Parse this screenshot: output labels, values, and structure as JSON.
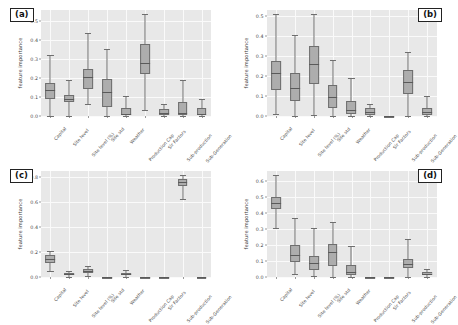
{
  "figure": {
    "ylabel": "feature importance",
    "categories": [
      "Capital",
      "Site level",
      "Site level (%)",
      "Site std",
      "Weather",
      "Production Cap",
      "Sir Factors",
      "Sub-production",
      "Sub-Generation"
    ]
  },
  "chart_data": [
    {
      "type": "boxplot",
      "panel": "(a)",
      "title": "(a)",
      "ylabel": "feature importance",
      "xlabel": "",
      "ylim": [
        0.0,
        0.56
      ],
      "yticks": [
        0.0,
        0.1,
        0.2,
        0.3,
        0.4,
        0.5
      ],
      "ytick_labels": [
        "0.0",
        "0.1",
        "0.2",
        "0.3",
        "0.4",
        "0.5"
      ],
      "grid": true,
      "legend": "none",
      "categories": [
        "Capital",
        "Site level",
        "Site level (%)",
        "Site std",
        "Weather",
        "Production Cap",
        "Sir Factors",
        "Sub-production",
        "Sub-Generation"
      ],
      "boxes": [
        {
          "label": "Capital",
          "whisker_low": 0.0,
          "q1": 0.092,
          "median": 0.135,
          "q3": 0.172,
          "whisker_high": 0.322
        },
        {
          "label": "Site level",
          "whisker_low": 0.0,
          "q1": 0.072,
          "median": 0.092,
          "q3": 0.112,
          "whisker_high": 0.19
        },
        {
          "label": "Site level (%)",
          "whisker_low": 0.062,
          "q1": 0.143,
          "median": 0.208,
          "q3": 0.248,
          "whisker_high": 0.44
        },
        {
          "label": "Site std",
          "whisker_low": 0.0,
          "q1": 0.046,
          "median": 0.126,
          "q3": 0.198,
          "whisker_high": 0.352
        },
        {
          "label": "Weather",
          "whisker_low": 0.0,
          "q1": 0.004,
          "median": 0.013,
          "q3": 0.041,
          "whisker_high": 0.108
        },
        {
          "label": "Production Cap",
          "whisker_low": 0.031,
          "q1": 0.221,
          "median": 0.28,
          "q3": 0.38,
          "whisker_high": 0.54
        },
        {
          "label": "Sir Factors",
          "whisker_low": 0.0,
          "q1": 0.006,
          "median": 0.018,
          "q3": 0.038,
          "whisker_high": 0.064
        },
        {
          "label": "Sub-production",
          "whisker_low": 0.0,
          "q1": 0.003,
          "median": 0.016,
          "q3": 0.076,
          "whisker_high": 0.19
        },
        {
          "label": "Sub-Generation",
          "whisker_low": 0.0,
          "q1": 0.004,
          "median": 0.013,
          "q3": 0.04,
          "whisker_high": 0.092
        }
      ]
    },
    {
      "type": "boxplot",
      "panel": "(b)",
      "title": "(b)",
      "ylabel": "feature importance",
      "xlabel": "",
      "ylim": [
        0.0,
        0.53
      ],
      "yticks": [
        0.0,
        0.1,
        0.2,
        0.3,
        0.4,
        0.5
      ],
      "ytick_labels": [
        "0.0",
        "0.1",
        "0.2",
        "0.3",
        "0.4",
        "0.5"
      ],
      "grid": true,
      "legend": "none",
      "categories": [
        "Capital",
        "Site level",
        "Site level (%)",
        "Site std",
        "Weather",
        "Production Cap",
        "Sir Factors",
        "Sub-production",
        "Sub-Generation"
      ],
      "boxes": [
        {
          "label": "Capital",
          "whisker_low": 0.01,
          "q1": 0.128,
          "median": 0.215,
          "q3": 0.274,
          "whisker_high": 0.508
        },
        {
          "label": "Site level",
          "whisker_low": 0.0,
          "q1": 0.073,
          "median": 0.138,
          "q3": 0.216,
          "whisker_high": 0.404
        },
        {
          "label": "Site level (%)",
          "whisker_low": 0.004,
          "q1": 0.16,
          "median": 0.262,
          "q3": 0.352,
          "whisker_high": 0.512
        },
        {
          "label": "Site std",
          "whisker_low": 0.002,
          "q1": 0.04,
          "median": 0.096,
          "q3": 0.156,
          "whisker_high": 0.282
        },
        {
          "label": "Weather",
          "whisker_low": 0.0,
          "q1": 0.008,
          "median": 0.031,
          "q3": 0.074,
          "whisker_high": 0.188
        },
        {
          "label": "Production Cap",
          "whisker_low": 0.0,
          "q1": 0.004,
          "median": 0.018,
          "q3": 0.038,
          "whisker_high": 0.06
        },
        {
          "label": "Sir Factors",
          "whisker_low": 0.0,
          "q1": 0.0,
          "median": 0.0,
          "q3": 0.001,
          "whisker_high": 0.002
        },
        {
          "label": "Sub-production",
          "whisker_low": 0.0,
          "q1": 0.112,
          "median": 0.172,
          "q3": 0.23,
          "whisker_high": 0.318
        },
        {
          "label": "Sub-Generation",
          "whisker_low": 0.0,
          "q1": 0.006,
          "median": 0.02,
          "q3": 0.042,
          "whisker_high": 0.1
        }
      ]
    },
    {
      "type": "boxplot",
      "panel": "(c)",
      "title": "(c)",
      "ylabel": "feature importance",
      "xlabel": "",
      "ylim": [
        0.0,
        0.85
      ],
      "yticks": [
        0.0,
        0.2,
        0.4,
        0.6,
        0.8
      ],
      "ytick_labels": [
        "0.0",
        "0.2",
        "0.4",
        "0.6",
        "0.8"
      ],
      "grid": true,
      "legend": "none",
      "categories": [
        "Capital",
        "Site level",
        "Site level (%)",
        "Site std",
        "Weather",
        "Production Cap",
        "Sir Factors",
        "Sub-production",
        "Sub-Generation"
      ],
      "boxes": [
        {
          "label": "Capital",
          "whisker_low": 0.046,
          "q1": 0.11,
          "median": 0.148,
          "q3": 0.178,
          "whisker_high": 0.212
        },
        {
          "label": "Site level",
          "whisker_low": 0.003,
          "q1": 0.013,
          "median": 0.024,
          "q3": 0.034,
          "whisker_high": 0.052
        },
        {
          "label": "Site level (%)",
          "whisker_low": 0.006,
          "q1": 0.032,
          "median": 0.05,
          "q3": 0.068,
          "whisker_high": 0.088
        },
        {
          "label": "Site std",
          "whisker_low": 0.0,
          "q1": 0.0,
          "median": 0.001,
          "q3": 0.002,
          "whisker_high": 0.003
        },
        {
          "label": "Weather",
          "whisker_low": 0.002,
          "q1": 0.013,
          "median": 0.022,
          "q3": 0.034,
          "whisker_high": 0.06
        },
        {
          "label": "Production Cap",
          "whisker_low": 0.0,
          "q1": 0.0,
          "median": 0.001,
          "q3": 0.002,
          "whisker_high": 0.003
        },
        {
          "label": "Sir Factors",
          "whisker_low": 0.0,
          "q1": 0.0,
          "median": 0.001,
          "q3": 0.002,
          "whisker_high": 0.003
        },
        {
          "label": "Sub-production",
          "whisker_low": 0.624,
          "q1": 0.726,
          "median": 0.758,
          "q3": 0.784,
          "whisker_high": 0.818
        },
        {
          "label": "Sub-Generation",
          "whisker_low": 0.0,
          "q1": 0.0,
          "median": 0.001,
          "q3": 0.002,
          "whisker_high": 0.003
        }
      ]
    },
    {
      "type": "boxplot",
      "panel": "(d)",
      "title": "(d)",
      "ylabel": "feature importance",
      "xlabel": "",
      "ylim": [
        0.0,
        0.66
      ],
      "yticks": [
        0.0,
        0.1,
        0.2,
        0.3,
        0.4,
        0.5,
        0.6
      ],
      "ytick_labels": [
        "0.0",
        "0.1",
        "0.2",
        "0.3",
        "0.4",
        "0.5",
        "0.6"
      ],
      "grid": true,
      "legend": "none",
      "categories": [
        "Capital",
        "Site level",
        "Site level (%)",
        "Site std",
        "Weather",
        "Production Cap",
        "Sir Factors",
        "Sub-production",
        "Sub-Generation"
      ],
      "boxes": [
        {
          "label": "Capital",
          "whisker_low": 0.302,
          "q1": 0.422,
          "median": 0.458,
          "q3": 0.498,
          "whisker_high": 0.638
        },
        {
          "label": "Site level",
          "whisker_low": 0.02,
          "q1": 0.092,
          "median": 0.136,
          "q3": 0.202,
          "whisker_high": 0.368
        },
        {
          "label": "Site level (%)",
          "whisker_low": 0.004,
          "q1": 0.046,
          "median": 0.086,
          "q3": 0.132,
          "whisker_high": 0.308
        },
        {
          "label": "Site std",
          "whisker_low": 0.0,
          "q1": 0.07,
          "median": 0.154,
          "q3": 0.208,
          "whisker_high": 0.344
        },
        {
          "label": "Weather",
          "whisker_low": 0.0,
          "q1": 0.01,
          "median": 0.034,
          "q3": 0.076,
          "whisker_high": 0.19
        },
        {
          "label": "Production Cap",
          "whisker_low": 0.0,
          "q1": 0.0,
          "median": 0.001,
          "q3": 0.002,
          "whisker_high": 0.003
        },
        {
          "label": "Sir Factors",
          "whisker_low": 0.0,
          "q1": 0.0,
          "median": 0.001,
          "q3": 0.002,
          "whisker_high": 0.003
        },
        {
          "label": "Sub-production",
          "whisker_low": 0.0,
          "q1": 0.056,
          "median": 0.078,
          "q3": 0.112,
          "whisker_high": 0.236
        },
        {
          "label": "Sub-Generation",
          "whisker_low": 0.0,
          "q1": 0.01,
          "median": 0.02,
          "q3": 0.032,
          "whisker_high": 0.048
        }
      ]
    }
  ]
}
